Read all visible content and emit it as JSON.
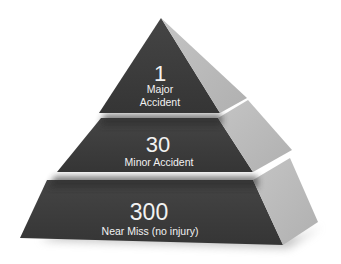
{
  "diagram": {
    "type": "pyramid",
    "colors": {
      "front_face": "#3b3b3b",
      "side_face": "#b9b9b9",
      "shadow": "#9a9a9a",
      "text": "#f2f2f2",
      "background": "#ffffff"
    },
    "tiers": [
      {
        "count": "1",
        "label_line1": "Major",
        "label_line2": "Accident"
      },
      {
        "count": "30",
        "label": "Minor Accident"
      },
      {
        "count": "300",
        "label": "Near Miss (no injury)"
      }
    ]
  }
}
